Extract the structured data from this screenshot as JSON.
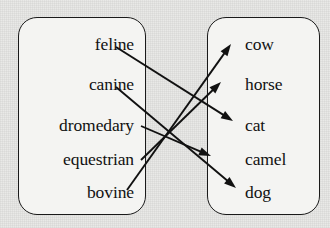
{
  "figure": {
    "background_color": "#e9e9e7",
    "box_fill_color": "#f4f4f2",
    "stroke_color": "#111111"
  },
  "left_box": {
    "name": "domain-box",
    "items": [
      {
        "label": "feline",
        "x": 134,
        "y": 45
      },
      {
        "label": "canine",
        "x": 134,
        "y": 85
      },
      {
        "label": "dromedary",
        "x": 134,
        "y": 126
      },
      {
        "label": "equestrian",
        "x": 134,
        "y": 160
      },
      {
        "label": "bovine",
        "x": 134,
        "y": 193
      }
    ]
  },
  "right_box": {
    "name": "codomain-box",
    "items": [
      {
        "label": "cow",
        "x": 245,
        "y": 45
      },
      {
        "label": "horse",
        "x": 245,
        "y": 85
      },
      {
        "label": "cat",
        "x": 245,
        "y": 126
      },
      {
        "label": "camel",
        "x": 245,
        "y": 160
      },
      {
        "label": "dog",
        "x": 245,
        "y": 193
      }
    ]
  },
  "arrows": [
    {
      "from": "feline",
      "to": "cat",
      "x1": 116,
      "y1": 47,
      "x2": 233,
      "y2": 121
    },
    {
      "from": "canine",
      "to": "dog",
      "x1": 116,
      "y1": 87,
      "x2": 236,
      "y2": 188
    },
    {
      "from": "dromedary",
      "to": "camel",
      "x1": 141,
      "y1": 126,
      "x2": 211,
      "y2": 156
    },
    {
      "from": "equestrian",
      "to": "horse",
      "x1": 141,
      "y1": 160,
      "x2": 221,
      "y2": 82
    },
    {
      "from": "bovine",
      "to": "cow",
      "x1": 127,
      "y1": 190,
      "x2": 231,
      "y2": 44
    }
  ]
}
